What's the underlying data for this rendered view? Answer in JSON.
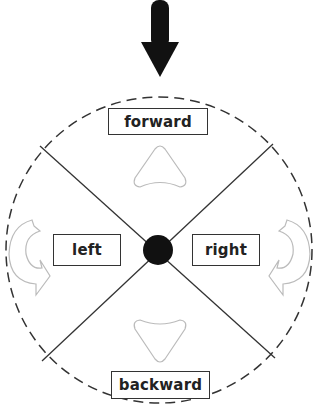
{
  "diagram": {
    "labels": {
      "forward": "forward",
      "left": "left",
      "right": "right",
      "backward": "backward"
    },
    "icons": {
      "top_pointer": "down-arrow-icon",
      "forward_indicator": "triangle-up-icon",
      "backward_indicator": "triangle-down-icon",
      "left_rotate": "rotate-counterclockwise-icon",
      "right_rotate": "rotate-clockwise-icon",
      "center": "center-dot"
    },
    "colors": {
      "stroke": "#333333",
      "dashed_circle": "#333333",
      "light_icon": "#bbbbbb",
      "center_dot": "#111111",
      "background": "#ffffff"
    }
  }
}
